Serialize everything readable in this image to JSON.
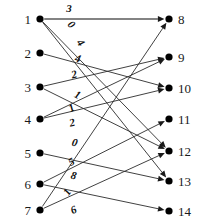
{
  "figure": {
    "type": "bipartite-flow-graph",
    "background_color": "#ffffff",
    "edge_color": "#2b2b2b",
    "node_color": "#000000",
    "label_color": "#1a1a1a"
  },
  "left_nodes": [
    {
      "id": "1",
      "label": "1",
      "x": 40,
      "y": 19
    },
    {
      "id": "2",
      "label": "2",
      "x": 40,
      "y": 53
    },
    {
      "id": "3",
      "label": "3",
      "x": 40,
      "y": 87
    },
    {
      "id": "4",
      "label": "4",
      "x": 40,
      "y": 119
    },
    {
      "id": "5",
      "label": "5",
      "x": 40,
      "y": 153
    },
    {
      "id": "6",
      "label": "6",
      "x": 40,
      "y": 184
    },
    {
      "id": "7",
      "label": "7",
      "x": 40,
      "y": 210
    }
  ],
  "right_nodes": [
    {
      "id": "8",
      "label": "8",
      "x": 169,
      "y": 19
    },
    {
      "id": "9",
      "label": "9",
      "x": 169,
      "y": 57
    },
    {
      "id": "10",
      "label": "10",
      "x": 169,
      "y": 88
    },
    {
      "id": "11",
      "label": "11",
      "x": 169,
      "y": 119
    },
    {
      "id": "12",
      "label": "12",
      "x": 169,
      "y": 151
    },
    {
      "id": "13",
      "label": "13",
      "x": 169,
      "y": 181
    },
    {
      "id": "14",
      "label": "14",
      "x": 169,
      "y": 211
    }
  ],
  "edges": [
    {
      "from": "1",
      "to": "8",
      "weight": "3",
      "wx": 69,
      "wy": 12,
      "style": "thick"
    },
    {
      "from": "1",
      "to": "12",
      "weight": "0",
      "wx": 69,
      "wy": 27,
      "style": "thin"
    },
    {
      "from": "1",
      "to": "13",
      "weight": "4",
      "wx": 78,
      "wy": 45,
      "style": "thin"
    },
    {
      "from": "2",
      "to": "10",
      "weight": "4",
      "wx": 77,
      "wy": 62,
      "style": "thin"
    },
    {
      "from": "3",
      "to": "9",
      "weight": "2",
      "wx": 75,
      "wy": 78,
      "style": "thin"
    },
    {
      "from": "3",
      "to": "12",
      "weight": "1",
      "wx": 76,
      "wy": 98,
      "style": "thin"
    },
    {
      "from": "4",
      "to": "9",
      "weight": "1",
      "wx": 73,
      "wy": 111,
      "style": "thin"
    },
    {
      "from": "4",
      "to": "10",
      "weight": "2",
      "wx": 73,
      "wy": 126,
      "style": "thin"
    },
    {
      "from": "5",
      "to": "13",
      "weight": "0",
      "wx": 74,
      "wy": 146,
      "style": "thin"
    },
    {
      "from": "6",
      "to": "11",
      "weight": "5",
      "wx": 73,
      "wy": 165,
      "style": "thin"
    },
    {
      "from": "6",
      "to": "14",
      "weight": "8",
      "wx": 73,
      "wy": 179,
      "style": "thin"
    },
    {
      "from": "7",
      "to": "8",
      "weight": "1",
      "wx": 70,
      "wy": 194,
      "style": "thin"
    },
    {
      "from": "7",
      "to": "12",
      "weight": "6",
      "wx": 75,
      "wy": 213,
      "style": "thin"
    }
  ]
}
